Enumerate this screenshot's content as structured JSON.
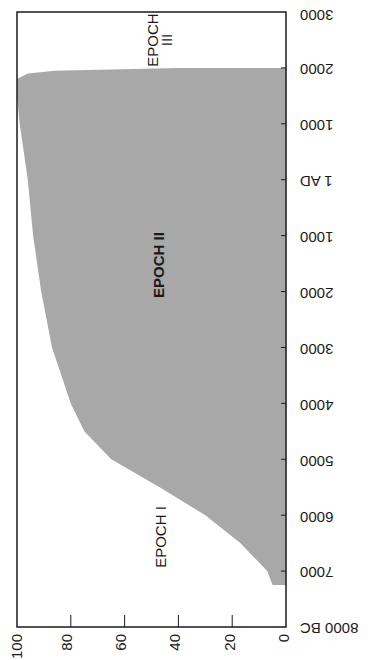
{
  "chart_data": {
    "type": "area",
    "orientation": "rotated-90",
    "title": "",
    "xlabel": "",
    "ylabel": "",
    "x_ticks": [
      "8000 BC",
      "7000",
      "6000",
      "5000",
      "4000",
      "3000",
      "2000",
      "1000",
      "1 AD",
      "1000",
      "2000",
      "3000"
    ],
    "x_tick_years": [
      -8000,
      -7000,
      -6000,
      -5000,
      -4000,
      -3000,
      -2000,
      -1000,
      0,
      1000,
      2000,
      3000
    ],
    "y_ticks": [
      "0",
      "20",
      "40",
      "60",
      "80",
      "100"
    ],
    "ylim": [
      0,
      100
    ],
    "xlim": [
      -8000,
      3000
    ],
    "grid": false,
    "series": [
      {
        "name": "share",
        "x": [
          -7250,
          -7250,
          -7000,
          -6500,
          -6000,
          -5500,
          -5000,
          -4500,
          -4000,
          -3000,
          -2000,
          -1000,
          0,
          1000,
          1500,
          1800,
          1900,
          1950,
          2000,
          2000
        ],
        "values": [
          0,
          5,
          7,
          17,
          30,
          47,
          65,
          75,
          80,
          87,
          91,
          94,
          96,
          99,
          100,
          100,
          96,
          86,
          40,
          0
        ],
        "fill": "#a8a8a8"
      }
    ],
    "annotations": [
      {
        "text": "EPOCH I",
        "x": -6300,
        "y": 48,
        "bold": false
      },
      {
        "text": "EPOCH II",
        "x": -2000,
        "y": 48,
        "bold": true
      },
      {
        "text": "EPOCH",
        "x": 2600,
        "y": 48,
        "bold": false
      },
      {
        "text": "III",
        "x": 2600,
        "y": 43,
        "bold": false
      }
    ]
  },
  "labels": {
    "x_ticks": [
      "8000  BC",
      "7000",
      "6000",
      "5000",
      "4000",
      "3000",
      "2000",
      "1000",
      "1  AD",
      "1000",
      "2000",
      "3000"
    ],
    "y_ticks": [
      "100",
      "80",
      "60",
      "40",
      "20",
      "0"
    ],
    "epoch1": "EPOCH I",
    "epoch2": "EPOCH II",
    "epoch3_line1": "EPOCH",
    "epoch3_line2": "III"
  },
  "colors": {
    "fill": "#a8a8a8",
    "frame": "#1a1a1a",
    "background": "#ffffff"
  }
}
